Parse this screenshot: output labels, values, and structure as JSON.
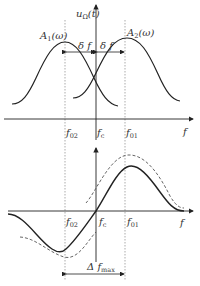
{
  "top_plot": {
    "y_axis_label": "u",
    "y_axis_sub": "Ω",
    "y_axis_arg": "(t)",
    "curve1_label": "A",
    "curve1_sub": "1",
    "curve1_arg": "(ω)",
    "curve2_label": "A",
    "curve2_sub": "2",
    "curve2_arg": "(ω)",
    "delta_left": "δ f",
    "delta_right": "δ f",
    "tick_f02": "f",
    "tick_f02_sub": "02",
    "tick_fc": "f",
    "tick_fc_sub": "c",
    "tick_f01": "f",
    "tick_f01_sub": "01",
    "x_axis_label": "f"
  },
  "bottom_plot": {
    "tick_f02": "f",
    "tick_f02_sub": "02",
    "tick_fc": "f",
    "tick_fc_sub": "c",
    "tick_f01": "f",
    "tick_f01_sub": "01",
    "x_axis_label": "f",
    "span_label": "Δ f",
    "span_sub": "max"
  },
  "colors": {
    "line": "#222222",
    "dashed": "#555555",
    "dotted": "#888888"
  }
}
